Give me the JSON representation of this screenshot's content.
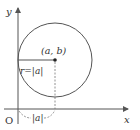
{
  "diagram": {
    "axes": {
      "x_label": "x",
      "y_label": "y",
      "origin_label": "O"
    },
    "circle": {
      "center_label": "(a, b)",
      "radius_label": "r=|a|",
      "distance_label": "|a|"
    },
    "colors": {
      "line": "#555555",
      "text": "#333333",
      "background": "#ffffff"
    }
  }
}
